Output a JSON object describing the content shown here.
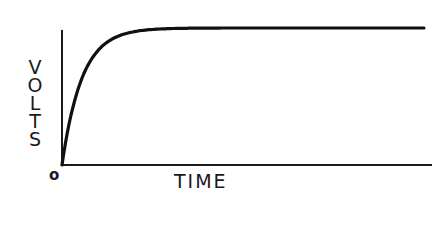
{
  "chart_data": {
    "type": "line",
    "title": "",
    "xlabel": "TIME",
    "ylabel": "VOLTS",
    "origin_label": "o",
    "x_ticks": [],
    "y_ticks": [],
    "grid": false,
    "legend": null,
    "series": [
      {
        "name": "voltage",
        "x": [
          0,
          0.02,
          0.05,
          0.1,
          0.15,
          0.2,
          0.25,
          0.3,
          1.0
        ],
        "y": [
          0,
          0.35,
          0.6,
          0.82,
          0.92,
          0.97,
          0.99,
          1.0,
          1.0
        ]
      }
    ],
    "xlim": [
      0,
      1
    ],
    "ylim": [
      0,
      1.03
    ]
  },
  "labels": {
    "ylabel_letters": [
      "V",
      "O",
      "L",
      "T",
      "S"
    ],
    "xlabel": "TIME",
    "origin": "o"
  },
  "colors": {
    "ink": "#1a1a1a",
    "background": "#ffffff"
  }
}
